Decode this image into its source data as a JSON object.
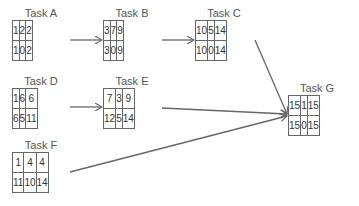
{
  "diagram": {
    "type": "PERT / critical path network",
    "tasks": [
      {
        "id": "A",
        "label": "Task A",
        "top": [
          1,
          2,
          2
        ],
        "bottom": [
          1,
          0,
          2
        ]
      },
      {
        "id": "B",
        "label": "Task B",
        "top": [
          3,
          7,
          9
        ],
        "bottom": [
          3,
          0,
          9
        ]
      },
      {
        "id": "C",
        "label": "Task C",
        "top": [
          10,
          5,
          14
        ],
        "bottom": [
          10,
          0,
          14
        ]
      },
      {
        "id": "D",
        "label": "Task D",
        "top": [
          1,
          6,
          6
        ],
        "bottom": [
          6,
          5,
          11
        ]
      },
      {
        "id": "E",
        "label": "Task E",
        "top": [
          7,
          3,
          9
        ],
        "bottom": [
          12,
          5,
          14
        ]
      },
      {
        "id": "F",
        "label": "Task F",
        "top": [
          1,
          4,
          4
        ],
        "bottom": [
          11,
          10,
          14
        ]
      },
      {
        "id": "G",
        "label": "Task G",
        "top": [
          15,
          1,
          15
        ],
        "bottom": [
          15,
          0,
          15
        ]
      }
    ],
    "edges": [
      {
        "from": "A",
        "to": "B"
      },
      {
        "from": "B",
        "to": "C"
      },
      {
        "from": "C",
        "to": "G"
      },
      {
        "from": "D",
        "to": "E"
      },
      {
        "from": "E",
        "to": "G"
      },
      {
        "from": "F",
        "to": "G"
      }
    ],
    "colors": {
      "line": "#666666",
      "text": "#333333",
      "label": "#555555"
    }
  }
}
